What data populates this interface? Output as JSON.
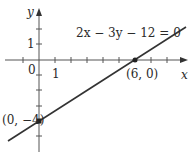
{
  "figure": {
    "equation": "2x − 3y − 12 = 0",
    "x_axis_label": "x",
    "y_axis_label": "y",
    "origin_label": "0",
    "x_tick_label": "1",
    "y_tick_label": "1",
    "points": [
      {
        "label": "(6, 0)",
        "x": 6,
        "y": 0
      },
      {
        "label": "(0, −4)",
        "x": 0,
        "y": -4
      }
    ],
    "line_color": "#333333",
    "axis_color": "#555555"
  }
}
